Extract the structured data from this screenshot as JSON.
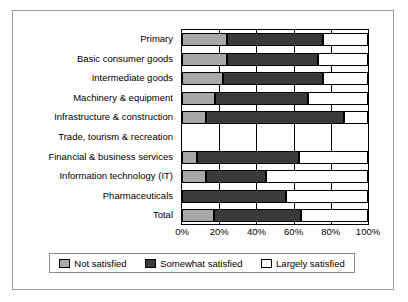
{
  "chart_data": {
    "type": "bar",
    "orientation": "horizontal",
    "stacked": true,
    "normalized": true,
    "title": "",
    "xlabel": "",
    "ylabel": "",
    "xlim": [
      0,
      100
    ],
    "grid": true,
    "legend_position": "bottom",
    "xticks": [
      "0%",
      "20%",
      "40%",
      "60%",
      "80%",
      "100%"
    ],
    "xtick_values": [
      0,
      20,
      40,
      60,
      80,
      100
    ],
    "categories": [
      "Primary",
      "Basic consumer goods",
      "Intermediate goods",
      "Machinery & equipment",
      "Infrastructure & construction",
      "Trade, tourism & recreation",
      "Financial & business services",
      "Information technology (IT)",
      "Pharmaceuticals",
      "Total"
    ],
    "series": [
      {
        "name": "Not satisfied",
        "color": "#a8a8a8",
        "values": [
          24,
          24,
          22,
          18,
          13,
          0,
          8,
          13,
          0,
          17
        ]
      },
      {
        "name": "Somewhat satisfied",
        "color": "#3a3a3a",
        "values": [
          52,
          49,
          54,
          50,
          74,
          0,
          55,
          32,
          56,
          47
        ]
      },
      {
        "name": "Largely satisfied",
        "color": "#ffffff",
        "values": [
          24,
          27,
          24,
          32,
          13,
          0,
          37,
          55,
          44,
          36
        ]
      }
    ]
  },
  "legend": {
    "items": [
      {
        "label": "Not satisfied",
        "color": "#a8a8a8"
      },
      {
        "label": "Somewhat satisfied",
        "color": "#3a3a3a"
      },
      {
        "label": "Largely satisfied",
        "color": "#ffffff"
      }
    ]
  }
}
